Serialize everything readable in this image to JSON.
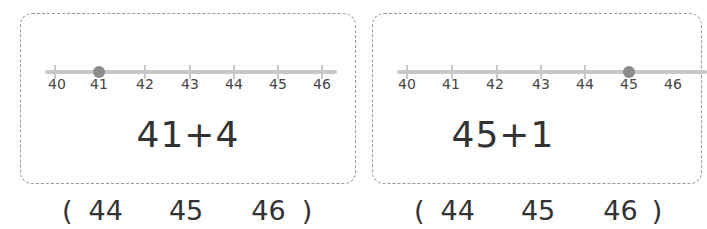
{
  "problems": [
    {
      "expression": "41+4",
      "number_line": {
        "ticks": [
          "40",
          "41",
          "42",
          "43",
          "44",
          "45",
          "46"
        ],
        "marked_value": "41",
        "marked_index": 1
      },
      "choices": {
        "open_paren": "(",
        "options": [
          "44",
          "45",
          "46"
        ],
        "close_paren": ")"
      }
    },
    {
      "expression": "45+1",
      "number_line": {
        "ticks": [
          "40",
          "41",
          "42",
          "43",
          "44",
          "45",
          "46"
        ],
        "marked_value": "45",
        "marked_index": 5
      },
      "choices": {
        "open_paren": "(",
        "options": [
          "44",
          "45",
          "46"
        ],
        "close_paren": ")"
      }
    }
  ],
  "colors": {
    "line": "#c8c8c8",
    "dot": "#8c8c8c",
    "border": "#9a9a9a",
    "text": "#333333"
  }
}
